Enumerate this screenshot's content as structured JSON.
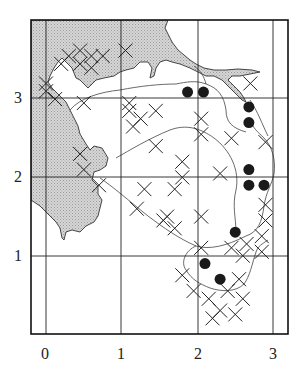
{
  "chart_data": {
    "type": "map",
    "title": "",
    "xlabel": "",
    "ylabel": "",
    "x_ticks": [
      "0",
      "1",
      "2",
      "3"
    ],
    "y_ticks": [
      "1",
      "2",
      "3"
    ],
    "grid": true,
    "xlim": [
      -0.2,
      3.2
    ],
    "ylim": [
      0,
      3.7
    ],
    "legend": "none visible",
    "symbols": {
      "cross": "occurrence record (X)",
      "dot": "filled circle record"
    },
    "dots": [
      {
        "x": 1.87,
        "y": 3.09
      },
      {
        "x": 2.08,
        "y": 3.09
      },
      {
        "x": 2.68,
        "y": 2.9
      },
      {
        "x": 2.68,
        "y": 2.7
      },
      {
        "x": 2.68,
        "y": 2.1
      },
      {
        "x": 2.68,
        "y": 1.9
      },
      {
        "x": 2.88,
        "y": 1.9
      },
      {
        "x": 2.5,
        "y": 1.3
      },
      {
        "x": 2.1,
        "y": 0.9
      },
      {
        "x": 2.3,
        "y": 0.7
      }
    ],
    "crosses": [
      {
        "x": 0.3,
        "y": 3.55
      },
      {
        "x": 0.45,
        "y": 3.62
      },
      {
        "x": 0.6,
        "y": 3.55
      },
      {
        "x": 0.45,
        "y": 3.45
      },
      {
        "x": 0.6,
        "y": 3.4
      },
      {
        "x": 0.75,
        "y": 3.55
      },
      {
        "x": 1.05,
        "y": 3.62
      },
      {
        "x": 0.0,
        "y": 3.1
      },
      {
        "x": 0.12,
        "y": 3.0
      },
      {
        "x": 0.2,
        "y": 3.45
      },
      {
        "x": 0.5,
        "y": 2.95
      },
      {
        "x": 0.0,
        "y": 3.2
      },
      {
        "x": 1.1,
        "y": 2.85
      },
      {
        "x": 1.25,
        "y": 2.75
      },
      {
        "x": 1.15,
        "y": 2.65
      },
      {
        "x": 1.45,
        "y": 2.85
      },
      {
        "x": 1.45,
        "y": 2.4
      },
      {
        "x": 1.1,
        "y": 2.95
      },
      {
        "x": 2.05,
        "y": 2.75
      },
      {
        "x": 2.05,
        "y": 2.55
      },
      {
        "x": 1.8,
        "y": 2.2
      },
      {
        "x": 1.8,
        "y": 2.0
      },
      {
        "x": 2.45,
        "y": 2.5
      },
      {
        "x": 2.9,
        "y": 2.45
      },
      {
        "x": 2.3,
        "y": 2.05
      },
      {
        "x": 0.45,
        "y": 2.3
      },
      {
        "x": 0.5,
        "y": 2.1
      },
      {
        "x": 0.7,
        "y": 1.9
      },
      {
        "x": 1.3,
        "y": 1.85
      },
      {
        "x": 1.7,
        "y": 1.85
      },
      {
        "x": 1.2,
        "y": 1.6
      },
      {
        "x": 1.6,
        "y": 1.5
      },
      {
        "x": 1.7,
        "y": 1.35
      },
      {
        "x": 1.55,
        "y": 1.45
      },
      {
        "x": 2.05,
        "y": 1.5
      },
      {
        "x": 2.9,
        "y": 1.65
      },
      {
        "x": 2.9,
        "y": 1.45
      },
      {
        "x": 2.85,
        "y": 1.25
      },
      {
        "x": 2.65,
        "y": 1.15
      },
      {
        "x": 2.85,
        "y": 1.05
      },
      {
        "x": 2.45,
        "y": 1.1
      },
      {
        "x": 2.05,
        "y": 1.1
      },
      {
        "x": 2.6,
        "y": 1.0
      },
      {
        "x": 1.8,
        "y": 0.75
      },
      {
        "x": 1.95,
        "y": 0.55
      },
      {
        "x": 2.15,
        "y": 0.45
      },
      {
        "x": 2.3,
        "y": 0.3
      },
      {
        "x": 2.5,
        "y": 0.25
      },
      {
        "x": 2.6,
        "y": 0.45
      },
      {
        "x": 2.4,
        "y": 0.55
      },
      {
        "x": 2.2,
        "y": 0.2
      },
      {
        "x": 2.55,
        "y": 0.7
      },
      {
        "x": 2.7,
        "y": 3.2
      }
    ]
  },
  "axes": {
    "x_labels": [
      "0",
      "1",
      "2",
      "3"
    ],
    "y_labels": [
      "1",
      "2",
      "3"
    ]
  }
}
